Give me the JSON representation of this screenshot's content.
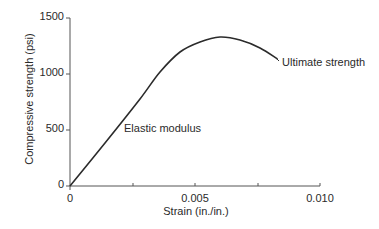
{
  "chart_data": {
    "type": "line",
    "title": "",
    "xlabel": "Strain (in./in.)",
    "ylabel": "Compressive strength (psi)",
    "xlim": [
      0,
      0.01
    ],
    "ylim": [
      0,
      1500
    ],
    "x_ticks": [
      "0",
      "0.005",
      "0.010"
    ],
    "x_minor_ticks": [
      0.0025,
      0.0075
    ],
    "y_ticks": [
      "0",
      "500",
      "1000",
      "1500"
    ],
    "grid": false,
    "legend": null,
    "series": [
      {
        "name": "Stress-strain curve",
        "x": [
          0,
          0.0014,
          0.0028,
          0.0036,
          0.0044,
          0.0052,
          0.006,
          0.0068,
          0.0076,
          0.0083
        ],
        "y": [
          0,
          384,
          777,
          1018,
          1196,
          1286,
          1330,
          1304,
          1232,
          1134
        ]
      }
    ],
    "annotations": [
      {
        "text": "Elastic modulus",
        "x": 0.0022,
        "y": 520
      },
      {
        "text": "Ultimate strength",
        "x": 0.0085,
        "y": 1150
      }
    ]
  },
  "labels": {
    "xlabel": "Strain (in./in.)",
    "ylabel": "Compressive strength (psi)",
    "y_ticks": [
      "0",
      "500",
      "1000",
      "1500"
    ],
    "x_ticks": [
      "0",
      "0.005",
      "0.010"
    ],
    "annot_elastic": "Elastic modulus",
    "annot_ultimate": "Ultimate strength"
  },
  "colors": {
    "axis": "#555555",
    "curve": "#2b2b2b",
    "text": "#2a2a2a"
  }
}
